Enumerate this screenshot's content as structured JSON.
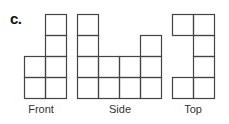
{
  "figure": {
    "part_label": "c.",
    "cell_size": 21,
    "line_color": "#444444",
    "views": [
      {
        "name": "Front",
        "origin": [
          24,
          14
        ],
        "cols": 2,
        "rows": 4,
        "cells": [
          [
            0,
            2
          ],
          [
            0,
            3
          ],
          [
            1,
            0
          ],
          [
            1,
            1
          ],
          [
            1,
            2
          ],
          [
            1,
            3
          ]
        ],
        "label_x": 16
      },
      {
        "name": "Side",
        "origin": [
          77,
          14
        ],
        "cols": 4,
        "rows": 4,
        "cells": [
          [
            0,
            0
          ],
          [
            0,
            1
          ],
          [
            0,
            2
          ],
          [
            0,
            3
          ],
          [
            1,
            2
          ],
          [
            1,
            3
          ],
          [
            2,
            2
          ],
          [
            2,
            3
          ],
          [
            3,
            1
          ],
          [
            3,
            2
          ],
          [
            3,
            3
          ]
        ],
        "label_x": 95
      },
      {
        "name": "Top",
        "origin": [
          172,
          14
        ],
        "cols": 2,
        "rows": 4,
        "cells": [
          [
            0,
            0
          ],
          [
            1,
            0
          ],
          [
            1,
            1
          ],
          [
            1,
            2
          ],
          [
            0,
            3
          ],
          [
            1,
            3
          ]
        ],
        "label_x": 168
      }
    ]
  }
}
